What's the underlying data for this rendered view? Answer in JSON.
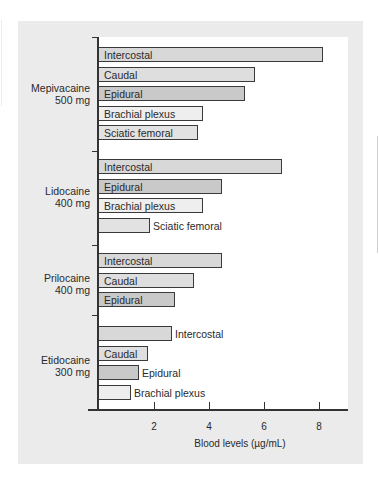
{
  "chart_data": {
    "type": "bar",
    "orientation": "horizontal",
    "title": "",
    "xlabel": "Blood levels (µg/mL)",
    "ylabel": "",
    "xlim": [
      0,
      9
    ],
    "x_ticks": [
      "2",
      "4",
      "6",
      "8"
    ],
    "grid": false,
    "legend": null,
    "groups": [
      {
        "drug": "Mepivacaine",
        "dose": "500 mg",
        "bars": [
          {
            "site": "Intercostal",
            "value": 8.2
          },
          {
            "site": "Caudal",
            "value": 5.7
          },
          {
            "site": "Epidural",
            "value": 5.35
          },
          {
            "site": "Brachial plexus",
            "value": 3.8
          },
          {
            "site": "Sciatic femoral",
            "value": 3.65
          }
        ]
      },
      {
        "drug": "Lidocaine",
        "dose": "400 mg",
        "bars": [
          {
            "site": "Intercostal",
            "value": 6.7
          },
          {
            "site": "Epidural",
            "value": 4.5
          },
          {
            "site": "Brachial plexus",
            "value": 3.8
          },
          {
            "site": "Sciatic femoral",
            "value": 1.9
          }
        ]
      },
      {
        "drug": "Prilocaine",
        "dose": "400 mg",
        "bars": [
          {
            "site": "Intercostal",
            "value": 4.5
          },
          {
            "site": "Caudal",
            "value": 3.5
          },
          {
            "site": "Epidural",
            "value": 2.8
          }
        ]
      },
      {
        "drug": "Etidocaine",
        "dose": "300 mg",
        "bars": [
          {
            "site": "Intercostal",
            "value": 2.7
          },
          {
            "site": "Caudal",
            "value": 1.8
          },
          {
            "site": "Epidural",
            "value": 1.5
          },
          {
            "site": "Brachial plexus",
            "value": 1.2
          }
        ]
      }
    ]
  },
  "colors": {
    "Intercostal": "#d8d8d8",
    "Caudal": "#dedede",
    "Epidural": "#c9c9c9",
    "Brachial plexus": "#eeeeee",
    "Sciatic femoral": "#e2e2e2",
    "panel": "#ebebeb"
  }
}
